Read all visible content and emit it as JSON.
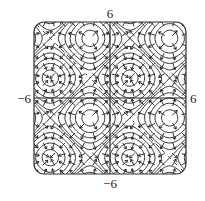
{
  "chart_data": {
    "type": "contour",
    "title": "",
    "function": "sin(x) + sin(y)",
    "xlim": [
      -6,
      6
    ],
    "ylim": [
      -6,
      6
    ],
    "x_tick_labels": {
      "min": "−6",
      "max": "6"
    },
    "y_tick_labels": {
      "min": "−6",
      "max": "6"
    },
    "contour_levels": [
      -1.8,
      -1.4,
      -1.0,
      -0.6,
      -0.2,
      0.2,
      0.6,
      1.0,
      1.4,
      1.8
    ],
    "saddle_level": 0,
    "gradient_arrows": true,
    "extrema": [
      {
        "x": -4.712,
        "y": 4.712,
        "kind": "min"
      },
      {
        "x": -1.571,
        "y": 4.712,
        "kind": "saddle-grid"
      },
      {
        "x": -1.571,
        "y": 1.571,
        "kind": "saddle"
      },
      {
        "x": 1.571,
        "y": 1.571,
        "kind": "max"
      },
      {
        "x": -1.571,
        "y": -1.571,
        "kind": "min"
      },
      {
        "x": 4.712,
        "y": -4.712,
        "kind": "max"
      }
    ],
    "line_color": "#1a1a1a",
    "frame_color": "#333333",
    "grid": false
  }
}
